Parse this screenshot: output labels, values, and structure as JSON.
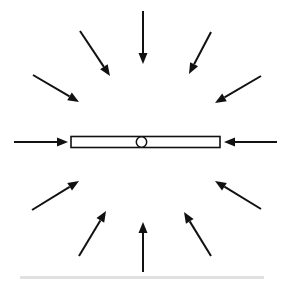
{
  "figure": {
    "width": 283,
    "height": 282,
    "background_color": "#ffffff",
    "ink_color": "#111111",
    "center": {
      "x": 141.5,
      "y": 142
    }
  },
  "beam": {
    "name": "horizontal beam",
    "x": 71,
    "y": 136.5,
    "width": 149,
    "height": 11,
    "fill_color": "#ffffff",
    "stroke_color": "#111111",
    "stroke_width": 1.6
  },
  "pivot": {
    "name": "center pivot",
    "cx": 141.5,
    "cy": 142,
    "r": 5.2,
    "fill_color": "#ffffff",
    "stroke_color": "#111111",
    "stroke_width": 1.5
  },
  "smudge": {
    "x": 20,
    "y": 276,
    "width": 244,
    "height": 3,
    "color": "#c9c9c9"
  },
  "arrows": {
    "count": 12,
    "direction": "inward",
    "stroke_width": 2.0,
    "head_length": 11,
    "head_width": 9,
    "items": [
      {
        "name": "arrow-left",
        "angle_deg": 180,
        "tail": {
          "x": 14,
          "y": 142
        },
        "tip": {
          "x": 68,
          "y": 142
        }
      },
      {
        "name": "arrow-right",
        "angle_deg": 0,
        "tail": {
          "x": 277,
          "y": 142
        },
        "tip": {
          "x": 224,
          "y": 142
        }
      },
      {
        "name": "arrow-top",
        "angle_deg": 90,
        "tail": {
          "x": 143,
          "y": 11
        },
        "tip": {
          "x": 143,
          "y": 64
        }
      },
      {
        "name": "arrow-bottom",
        "angle_deg": 270,
        "tail": {
          "x": 143,
          "y": 272
        },
        "tip": {
          "x": 143,
          "y": 222
        }
      },
      {
        "name": "arrow-top-left-upper",
        "angle_deg": 120,
        "tail": {
          "x": 80,
          "y": 31
        },
        "tip": {
          "x": 110,
          "y": 76
        }
      },
      {
        "name": "arrow-top-left-lower",
        "angle_deg": 150,
        "tail": {
          "x": 33,
          "y": 75
        },
        "tip": {
          "x": 79,
          "y": 102
        }
      },
      {
        "name": "arrow-top-right-upper",
        "angle_deg": 60,
        "tail": {
          "x": 211,
          "y": 32
        },
        "tip": {
          "x": 189,
          "y": 74
        }
      },
      {
        "name": "arrow-top-right-lower",
        "angle_deg": 30,
        "tail": {
          "x": 261,
          "y": 76
        },
        "tip": {
          "x": 215,
          "y": 103
        }
      },
      {
        "name": "arrow-bottom-left-lower",
        "angle_deg": 240,
        "tail": {
          "x": 79,
          "y": 256
        },
        "tip": {
          "x": 106,
          "y": 211
        }
      },
      {
        "name": "arrow-bottom-left-upper",
        "angle_deg": 210,
        "tail": {
          "x": 32,
          "y": 210
        },
        "tip": {
          "x": 79,
          "y": 181
        }
      },
      {
        "name": "arrow-bottom-right-lower",
        "angle_deg": 300,
        "tail": {
          "x": 211,
          "y": 256
        },
        "tip": {
          "x": 184,
          "y": 212
        }
      },
      {
        "name": "arrow-bottom-right-upper",
        "angle_deg": 330,
        "tail": {
          "x": 261,
          "y": 209
        },
        "tip": {
          "x": 215,
          "y": 181
        }
      }
    ]
  }
}
